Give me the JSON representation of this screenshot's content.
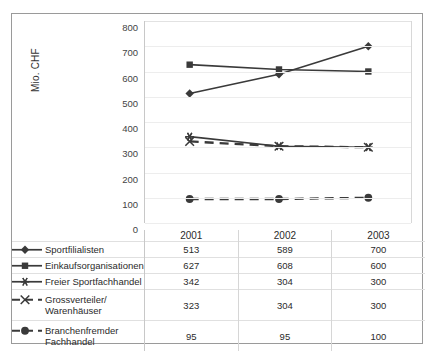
{
  "figure": {
    "border_color": "#9a9a9a",
    "background": "#ffffff"
  },
  "chart_data": {
    "type": "line",
    "title": "",
    "xlabel": "",
    "ylabel": "Mio. CHF",
    "categories": [
      "2001",
      "2002",
      "2003"
    ],
    "ylim": [
      0,
      800
    ],
    "ytick_labels": [
      "800",
      "700",
      "600",
      "500",
      "400",
      "300",
      "200",
      "100",
      "0"
    ],
    "ytick_values": [
      800,
      700,
      600,
      500,
      400,
      300,
      200,
      100,
      0
    ],
    "grid": true,
    "legend_position": "table-left",
    "series": [
      {
        "name": "Sportfilialisten",
        "values": [
          513,
          589,
          700
        ],
        "marker": "diamond",
        "linestyle": "solid",
        "color": "#3a3a3a"
      },
      {
        "name": "Einkaufsorganisationen",
        "values": [
          627,
          608,
          600
        ],
        "marker": "square",
        "linestyle": "solid",
        "color": "#3a3a3a"
      },
      {
        "name": "Freier Sportfachhandel",
        "values": [
          342,
          304,
          300
        ],
        "marker": "star",
        "linestyle": "solid",
        "color": "#3a3a3a"
      },
      {
        "name": "Grossverteiler/\nWarenhäuser",
        "values": [
          323,
          304,
          300
        ],
        "marker": "x",
        "linestyle": "dashed",
        "color": "#3a3a3a"
      },
      {
        "name": "Branchenfremder\nFachhandel",
        "values": [
          95,
          95,
          100
        ],
        "marker": "circle",
        "linestyle": "dashed",
        "color": "#3a3a3a"
      }
    ]
  },
  "table": {
    "header": [
      "",
      "2001",
      "2002",
      "2003"
    ],
    "rows": [
      {
        "label": "Sportfilialisten",
        "values": [
          "513",
          "589",
          "700"
        ]
      },
      {
        "label": "Einkaufsorganisationen",
        "values": [
          "627",
          "608",
          "600"
        ]
      },
      {
        "label": "Freier Sportfachhandel",
        "values": [
          "342",
          "304",
          "300"
        ]
      },
      {
        "label": "Grossverteiler/\nWarenhäuser",
        "values": [
          "323",
          "304",
          "300"
        ]
      },
      {
        "label": "Branchenfremder\nFachhandel",
        "values": [
          "95",
          "95",
          "100"
        ]
      }
    ]
  }
}
